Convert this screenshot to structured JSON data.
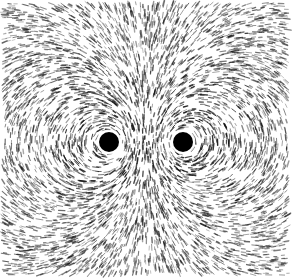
{
  "image": {
    "description": "Iron filings aligned along magnetic field lines around two parallel current-carrying wires",
    "width": 293,
    "height": 278,
    "background": "#ffffff",
    "ink": "#111111",
    "field_area": {
      "x": 3,
      "y": 3,
      "w": 285,
      "h": 272
    },
    "wires": [
      {
        "name": "left-wire",
        "cx": 109,
        "cy": 142,
        "r": 10
      },
      {
        "name": "right-wire",
        "cx": 183,
        "cy": 142,
        "r": 10
      }
    ]
  }
}
